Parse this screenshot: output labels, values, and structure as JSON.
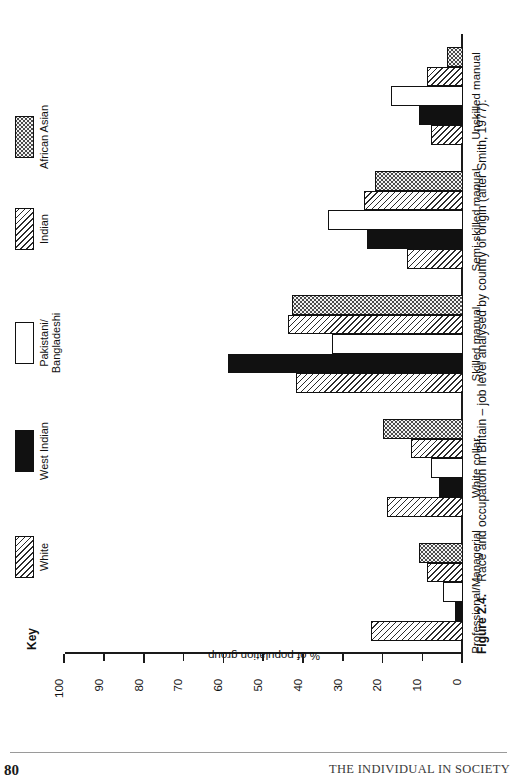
{
  "page": {
    "number": "80",
    "running_head": "THE INDIVIDUAL IN SOCIETY"
  },
  "caption": {
    "figure_label": "Figure 2.4.",
    "text": "Race and occupation in Britain – job level analysed by country of origin (after Smith, 1977)."
  },
  "legend": {
    "title": "Key",
    "items": [
      {
        "label": "White",
        "pattern": "diagonal-hatch"
      },
      {
        "label": "West Indian",
        "pattern": "solid-black"
      },
      {
        "label": "Pakistani/\nBangladeshi",
        "pattern": "white-empty"
      },
      {
        "label": "Indian",
        "pattern": "diagonal-hatch"
      },
      {
        "label": "African Asian",
        "pattern": "stipple"
      }
    ]
  },
  "chart_data": {
    "type": "bar",
    "title": "Race and occupation in Britain – job level analysed by country of origin (after Smith, 1977).",
    "xlabel": "",
    "ylabel": "% of population group",
    "ylim": [
      0,
      100
    ],
    "yticks": [
      0,
      10,
      20,
      30,
      40,
      50,
      60,
      70,
      80,
      90,
      100
    ],
    "ytick_labels": [
      "0",
      "10",
      "20",
      "30",
      "40",
      "50",
      "60",
      "70",
      "80",
      "90",
      "100"
    ],
    "grid": false,
    "legend_position": "top-left",
    "orientation": "vertical-bars-rotated-page",
    "categories": [
      "Professional/Managerial",
      "White collar",
      "Skilled manual",
      "Semi-skilled manual",
      "Unskilled manual"
    ],
    "series": [
      {
        "name": "White",
        "values": [
          23,
          19,
          42,
          14,
          8
        ]
      },
      {
        "name": "West Indian",
        "values": [
          2,
          6,
          59,
          24,
          11
        ]
      },
      {
        "name": "Pakistani/Bangladeshi",
        "values": [
          5,
          8,
          33,
          34,
          18
        ]
      },
      {
        "name": "Indian",
        "values": [
          9,
          13,
          44,
          25,
          9
        ]
      },
      {
        "name": "African Asian",
        "values": [
          11,
          20,
          43,
          22,
          4
        ]
      }
    ]
  }
}
